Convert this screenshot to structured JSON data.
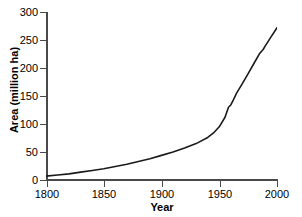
{
  "chart_data": {
    "type": "line",
    "title": "",
    "xlabel": "Year",
    "ylabel": "Area (million ha)",
    "xlim": [
      1800,
      2000
    ],
    "ylim": [
      0,
      300
    ],
    "grid": false,
    "legend": "none",
    "xticks": [
      1800,
      1850,
      1900,
      1950,
      2000
    ],
    "xtick_labels": [
      "1800",
      "1850",
      "1900",
      "1950",
      "2000"
    ],
    "yticks": [
      0,
      50,
      100,
      150,
      200,
      250,
      300
    ],
    "ytick_labels": [
      "0",
      "50",
      "100",
      "150",
      "200",
      "250",
      "300"
    ],
    "line_color": "#1a1a1a",
    "axis_color": "#4a4a4a",
    "background": "#ffffff",
    "series": [
      {
        "name": "Irrigated area",
        "x": [
          1800,
          1810,
          1820,
          1830,
          1840,
          1850,
          1860,
          1870,
          1880,
          1890,
          1900,
          1910,
          1920,
          1930,
          1940,
          1945,
          1950,
          1955,
          1958,
          1960,
          1962,
          1965,
          1970,
          1975,
          1980,
          1985,
          1988,
          1990,
          1995,
          2000
        ],
        "y": [
          7,
          9,
          11,
          14,
          17,
          20,
          24,
          28,
          33,
          38,
          44,
          50,
          57,
          65,
          76,
          84,
          95,
          112,
          130,
          134,
          142,
          155,
          172,
          190,
          208,
          226,
          233,
          240,
          256,
          272
        ]
      }
    ]
  }
}
